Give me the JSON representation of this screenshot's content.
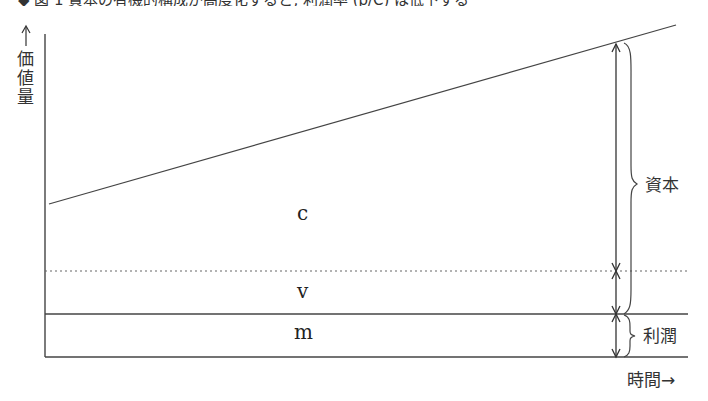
{
  "header": {
    "cut_text": "◆ 図 1  資本の有機的構成が高度化すると, 利潤率 (p/C) は低下する"
  },
  "diagram": {
    "y_axis_label": "↑価値量",
    "y_axis_arrow": "↑",
    "y_axis_chars": [
      "価",
      "値",
      "量"
    ],
    "x_axis_label": "時間→",
    "regions": {
      "c": "c",
      "v": "v",
      "m": "m"
    },
    "brace_capital_label": "資本",
    "brace_profit_label": "利潤",
    "colors": {
      "line": "#333333",
      "dotted": "#555555"
    }
  }
}
